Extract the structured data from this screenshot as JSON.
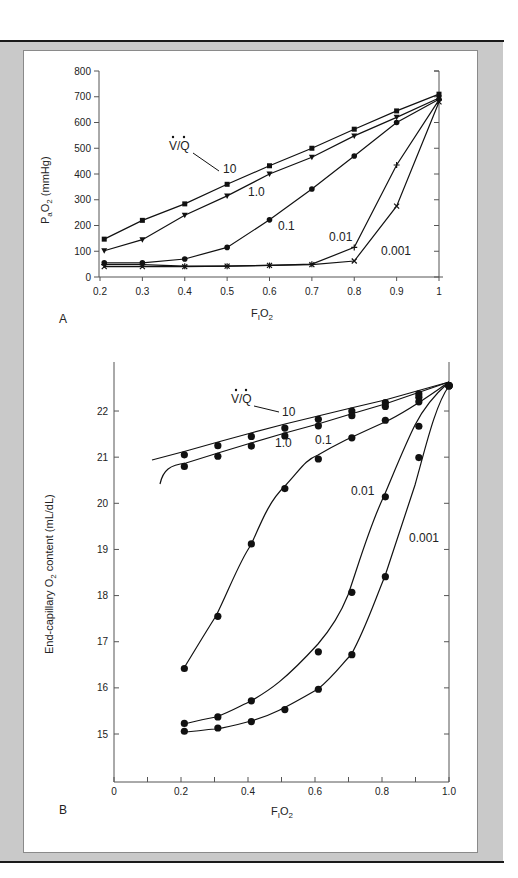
{
  "chart_data": [
    {
      "panel": "A",
      "type": "line",
      "title": "",
      "xlabel": "FIO2",
      "ylabel": "PaO2 (mmHg)",
      "xlim": [
        0.2,
        1.0
      ],
      "ylim": [
        0,
        800
      ],
      "x_ticks": [
        "0.2",
        "0.3",
        "0.4",
        "0.5",
        "0.6",
        "0.7",
        "0.8",
        "0.9",
        "1"
      ],
      "y_ticks": [
        "0",
        "100",
        "200",
        "300",
        "400",
        "500",
        "600",
        "700",
        "800"
      ],
      "legend_title": "V/Q",
      "grid": false,
      "x": [
        0.21,
        0.3,
        0.4,
        0.5,
        0.6,
        0.7,
        0.8,
        0.9,
        1.0
      ],
      "series": [
        {
          "name": "10",
          "marker": "square",
          "values": [
            147,
            220,
            284,
            360,
            432,
            500,
            574,
            645,
            710
          ]
        },
        {
          "name": "1.0",
          "marker": "triangle-down",
          "values": [
            102,
            145,
            240,
            315,
            400,
            465,
            548,
            620,
            695
          ]
        },
        {
          "name": "0.1",
          "marker": "circle",
          "values": [
            55,
            55,
            70,
            115,
            222,
            342,
            470,
            600,
            690
          ]
        },
        {
          "name": "0.01",
          "marker": "plus",
          "values": [
            48,
            48,
            42,
            42,
            45,
            50,
            115,
            435,
            688
          ]
        },
        {
          "name": "0.001",
          "marker": "x",
          "values": [
            40,
            40,
            40,
            42,
            45,
            48,
            62,
            275,
            680
          ]
        }
      ]
    },
    {
      "panel": "B",
      "type": "line",
      "title": "",
      "xlabel": "FIO2",
      "ylabel": "End-capillary O2 content (mL/dL)",
      "xlim": [
        0,
        1.0
      ],
      "ylim": [
        14,
        23
      ],
      "x_ticks": [
        "0",
        "0.2",
        "0.4",
        "0.6",
        "0.8",
        "1.0"
      ],
      "y_ticks": [
        "15",
        "16",
        "17",
        "18",
        "19",
        "20",
        "21",
        "22"
      ],
      "legend_title": "V/Q",
      "grid": false,
      "x": [
        0.21,
        0.31,
        0.41,
        0.51,
        0.61,
        0.71,
        0.81,
        0.91,
        1.0
      ],
      "series": [
        {
          "name": "10",
          "marker": "circle",
          "values": [
            21.05,
            21.25,
            21.45,
            21.63,
            21.82,
            22.0,
            22.18,
            22.37,
            22.55
          ]
        },
        {
          "name": "1.0",
          "marker": "circle",
          "values": [
            20.8,
            21.02,
            21.24,
            21.46,
            21.68,
            21.9,
            22.1,
            22.3,
            22.55
          ]
        },
        {
          "name": "0.1",
          "marker": "circle",
          "values": [
            16.42,
            17.55,
            19.12,
            20.32,
            20.96,
            21.42,
            21.8,
            22.2,
            22.55
          ]
        },
        {
          "name": "0.01",
          "marker": "circle",
          "values": [
            15.23,
            15.37,
            15.72,
            null,
            16.78,
            18.07,
            20.14,
            21.67,
            22.55
          ]
        },
        {
          "name": "0.001",
          "marker": "circle",
          "values": [
            15.06,
            15.13,
            15.27,
            15.53,
            15.97,
            16.72,
            18.41,
            20.99,
            22.55
          ]
        }
      ]
    }
  ],
  "panelA": {
    "letter": "A",
    "ylabel_main": "P",
    "ylabel_sub": "a",
    "ylabel_main2": "O",
    "ylabel_sub2": "2",
    "ylabel_rest": " (mmHg)",
    "xlabel_main": "F",
    "xlabel_sub": "I",
    "xlabel_main2": "O",
    "xlabel_sub2": "2",
    "legend_title": "V/Q",
    "labels": {
      "s10": "10",
      "s1": "1.0",
      "s01": "0.1",
      "s001": "0.01",
      "s0001": "0.001"
    },
    "x_ticks": [
      "0.2",
      "0.3",
      "0.4",
      "0.5",
      "0.6",
      "0.7",
      "0.8",
      "0.9",
      "1"
    ],
    "y_ticks": [
      "0",
      "100",
      "200",
      "300",
      "400",
      "500",
      "600",
      "700",
      "800"
    ]
  },
  "panelB": {
    "letter": "B",
    "ylabel_a": "End-capillary O",
    "ylabel_sub": "2",
    "ylabel_b": " content (mL/dL)",
    "xlabel_main": "F",
    "xlabel_sub": "I",
    "xlabel_main2": "O",
    "xlabel_sub2": "2",
    "legend_title": "V/Q",
    "labels": {
      "s10": "10",
      "s1": "1.0",
      "s01": "0.1",
      "s001": "0.01",
      "s0001": "0.001"
    },
    "x_ticks": [
      "0",
      "0.2",
      "0.4",
      "0.6",
      "0.8",
      "1.0"
    ],
    "y_ticks": [
      "15",
      "16",
      "17",
      "18",
      "19",
      "20",
      "21",
      "22"
    ]
  },
  "colors": {
    "frame": "#c9c9c9",
    "panel": "#ffffff",
    "ink": "#111111",
    "axis": "#555555"
  }
}
